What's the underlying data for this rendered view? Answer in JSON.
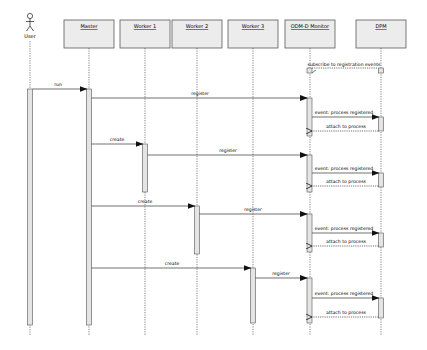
{
  "diagram": {
    "type": "sequence",
    "colors": {
      "box_fill": "#ececec",
      "box_stroke": "#5a5a5a",
      "activation_fill": "#e4e4e4",
      "line": "#333333",
      "background": "#ffffff"
    },
    "actor": {
      "label": "User",
      "x": 30
    },
    "participants": [
      {
        "id": "master",
        "label": "Master",
        "x": 89
      },
      {
        "id": "worker1",
        "label": "Worker 1",
        "x": 145
      },
      {
        "id": "worker2",
        "label": "Worker 2",
        "x": 197
      },
      {
        "id": "worker3",
        "label": "Worker 3",
        "x": 253
      },
      {
        "id": "monitor",
        "label": "ODM-D Monitor",
        "x": 310
      },
      {
        "id": "dpm",
        "label": "DPM",
        "x": 381
      }
    ],
    "messages": [
      {
        "from": "monitor",
        "to": "dpm",
        "label": "subscribe to registration events",
        "style": "dashed",
        "y": 64
      },
      {
        "from": "user",
        "to": "master",
        "label": "run",
        "style": "solid",
        "y": 89
      },
      {
        "from": "master",
        "to": "monitor",
        "label": "register",
        "style": "solid",
        "y": 98
      },
      {
        "from": "monitor",
        "to": "dpm",
        "label": "event: process registered",
        "style": "solid",
        "y": 117
      },
      {
        "from": "dpm",
        "to": "monitor",
        "label": "attach to process",
        "style": "dashed-return",
        "y": 131
      },
      {
        "from": "master",
        "to": "worker1",
        "label": "create",
        "style": "solid",
        "y": 144
      },
      {
        "from": "worker1",
        "to": "monitor",
        "label": "register",
        "style": "solid",
        "y": 155
      },
      {
        "from": "monitor",
        "to": "dpm",
        "label": "event: process registered",
        "style": "solid",
        "y": 173
      },
      {
        "from": "dpm",
        "to": "monitor",
        "label": "attach to process",
        "style": "dashed-return",
        "y": 186
      },
      {
        "from": "master",
        "to": "worker2",
        "label": "create",
        "style": "solid",
        "y": 206
      },
      {
        "from": "worker2",
        "to": "monitor",
        "label": "register",
        "style": "solid",
        "y": 214
      },
      {
        "from": "monitor",
        "to": "dpm",
        "label": "event: process registered",
        "style": "solid",
        "y": 233
      },
      {
        "from": "dpm",
        "to": "monitor",
        "label": "attach to process",
        "style": "dashed-return",
        "y": 246
      },
      {
        "from": "master",
        "to": "worker3",
        "label": "create",
        "style": "solid",
        "y": 268
      },
      {
        "from": "worker3",
        "to": "monitor",
        "label": "register",
        "style": "solid",
        "y": 278
      },
      {
        "from": "monitor",
        "to": "dpm",
        "label": "event: process registered",
        "style": "solid",
        "y": 298
      },
      {
        "from": "dpm",
        "to": "monitor",
        "label": "attach to process",
        "style": "dashed-return",
        "y": 317
      }
    ]
  }
}
